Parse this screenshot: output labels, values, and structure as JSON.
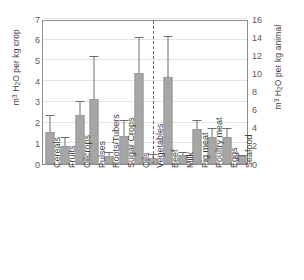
{
  "chart_data": {
    "type": "bar",
    "title": "",
    "xlabel": "",
    "ylabel": "m3 H2O per kg crop",
    "ylabel_left_display": "m3 H2O per kg crop",
    "ylabel_right_display": "m3 H2O per kg animal",
    "ylim": [
      0,
      7
    ],
    "ylim_right": [
      0,
      16
    ],
    "yticks": [
      0,
      1,
      2,
      3,
      4,
      5,
      6,
      7
    ],
    "yticks_right": [
      0,
      2,
      4,
      6,
      8,
      10,
      12,
      14,
      16
    ],
    "grid": true,
    "legend": "none",
    "annotations": [
      {
        "type": "vertical-dashed-line",
        "after_category": "Vegetables",
        "note": "separates crop products (left axis) from animal products (right axis)"
      }
    ],
    "categories": [
      "Cereals",
      "Fruits",
      "Oilcrops",
      "Pulses",
      "Roots/Tubers",
      "Sugar Crops",
      "Oils",
      "Vegetables",
      "Beef",
      "Milk",
      "Pig meat",
      "Poultry meat",
      "Eggs",
      "Seafood"
    ],
    "axis_group": [
      "left",
      "left",
      "left",
      "left",
      "left",
      "left",
      "left",
      "left",
      "right",
      "right",
      "right",
      "right",
      "right",
      "right"
    ],
    "values": [
      1.55,
      0.85,
      2.35,
      3.15,
      0.4,
      1.35,
      4.4,
      0.3,
      9.6,
      0.95,
      3.9,
      3.0,
      3.0,
      0.85
    ],
    "error_high": [
      2.3,
      1.25,
      3.0,
      5.15,
      0.55,
      2.1,
      6.1,
      0.45,
      14.0,
      1.25,
      4.8,
      3.9,
      3.9,
      0.85
    ],
    "error_low": [
      0.9,
      0.55,
      2.1,
      1.9,
      0.3,
      0.75,
      2.6,
      0.2,
      7.4,
      0.7,
      3.0,
      2.3,
      2.3,
      0.85
    ],
    "series": [
      {
        "name": "Water footprint",
        "values": [
          1.55,
          0.85,
          2.35,
          3.15,
          0.4,
          1.35,
          4.4,
          0.3,
          9.6,
          0.95,
          3.9,
          3.0,
          3.0,
          0.85
        ]
      }
    ],
    "bar_color": "#a6a6a6",
    "error_color": "#6e6e6e",
    "gridline_color": "#e4e4e4",
    "axis_color": "#8c8c8c"
  }
}
